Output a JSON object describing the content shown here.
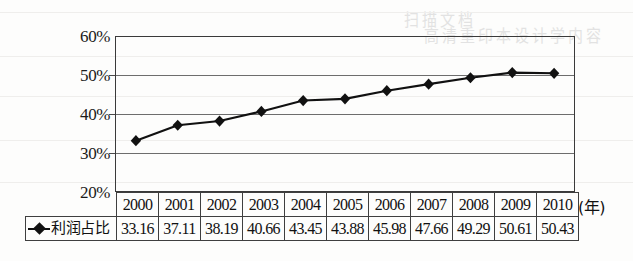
{
  "chart_data": {
    "type": "line",
    "title": "",
    "xlabel": "(年)",
    "ylabel": "",
    "categories": [
      "2000",
      "2001",
      "2002",
      "2003",
      "2004",
      "2005",
      "2006",
      "2007",
      "2008",
      "2009",
      "2010"
    ],
    "series": [
      {
        "name": "利润占比",
        "values": [
          33.16,
          37.11,
          38.19,
          40.66,
          43.45,
          43.88,
          45.98,
          47.66,
          49.29,
          50.61,
          50.43
        ],
        "marker": "diamond",
        "color": "#111111"
      }
    ],
    "ylim": [
      20,
      60
    ],
    "ytick_values": [
      20,
      30,
      40,
      50,
      60
    ],
    "ytick_labels": [
      "20%",
      "30%",
      "40%",
      "50%",
      "60%"
    ],
    "grid": true,
    "legend_position": "table-left",
    "value_suffix": "%"
  },
  "axis": {
    "y_labels": [
      "60%",
      "50%",
      "40%",
      "30%",
      "20%"
    ],
    "x_unit": "(年)"
  },
  "table": {
    "legend_label": "利润占比",
    "headers": [
      "2000",
      "2001",
      "2002",
      "2003",
      "2004",
      "2005",
      "2006",
      "2007",
      "2008",
      "2009",
      "2010"
    ],
    "values": [
      "33.16",
      "37.11",
      "38.19",
      "40.66",
      "43.45",
      "43.88",
      "45.98",
      "47.66",
      "49.29",
      "50.61",
      "50.43"
    ]
  },
  "artifacts": {
    "ghost_text_1": "扫描文档",
    "ghost_text_2": "高清重印本设计学内容"
  }
}
